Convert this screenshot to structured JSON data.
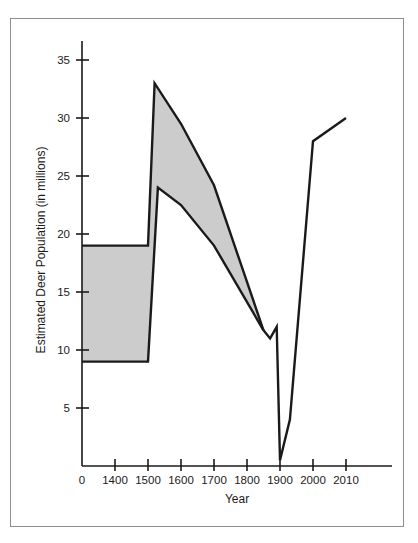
{
  "figure": {
    "border_color": "#8d8d8d",
    "background": "#ffffff"
  },
  "chart_data": {
    "type": "area",
    "title": "",
    "subtitle": "",
    "xlabel": "Year",
    "ylabel": "Estimated Deer Population (in millions)",
    "xtick_labels": [
      "0",
      "1400",
      "1500",
      "1600",
      "1700",
      "1800",
      "1900",
      "2000",
      "2010"
    ],
    "ytick_labels": [
      "5",
      "10",
      "15",
      "20",
      "25",
      "30",
      "35"
    ],
    "ytick_values": [
      5,
      10,
      15,
      20,
      25,
      30,
      35
    ],
    "ylim": [
      0,
      36.5
    ],
    "grid": false,
    "legend": null,
    "line_color": "#1a1a1a",
    "band_fill_color": "#cccccc",
    "axis_color": "#1a1a1a",
    "series": [
      {
        "name": "Upper estimate",
        "points": [
          {
            "x": "0",
            "y": 19
          },
          {
            "x": "1400",
            "y": 19
          },
          {
            "x": "1500",
            "y": 19
          },
          {
            "x": "1520",
            "y": 33
          },
          {
            "x": "1600",
            "y": 29.5
          },
          {
            "x": "1700",
            "y": 24.2
          },
          {
            "x": "1850",
            "y": 11.7
          }
        ]
      },
      {
        "name": "Lower estimate",
        "points": [
          {
            "x": "0",
            "y": 9
          },
          {
            "x": "1400",
            "y": 9
          },
          {
            "x": "1500",
            "y": 9
          },
          {
            "x": "1530",
            "y": 24
          },
          {
            "x": "1600",
            "y": 22.5
          },
          {
            "x": "1700",
            "y": 19
          },
          {
            "x": "1850",
            "y": 11.7
          }
        ]
      },
      {
        "name": "Population after convergence",
        "points": [
          {
            "x": "1850",
            "y": 11.7
          },
          {
            "x": "1870",
            "y": 11
          },
          {
            "x": "1890",
            "y": 12
          },
          {
            "x": "1900",
            "y": 0.5
          },
          {
            "x": "1930",
            "y": 4
          },
          {
            "x": "2000",
            "y": 28
          },
          {
            "x": "2010",
            "y": 30
          }
        ]
      }
    ]
  }
}
